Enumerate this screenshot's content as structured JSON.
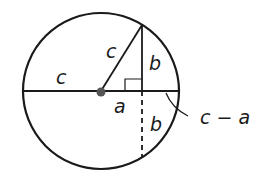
{
  "diagram": {
    "type": "geometry",
    "colors": {
      "stroke": "#1a1a1a",
      "center_dot": "#555555",
      "background": "#ffffff"
    },
    "labels": {
      "radius_left": "c",
      "hypotenuse": "c",
      "leg_vertical_top": "b",
      "leg_horizontal": "a",
      "chord_lower": "b",
      "remainder": "c − a"
    }
  }
}
